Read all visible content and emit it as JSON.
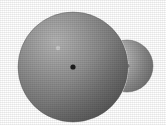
{
  "scene": {
    "title": "Two overlapping shaded spheres",
    "canvas": {
      "width": 166,
      "height": 125
    },
    "background_color": "#ffffff",
    "caption": ""
  },
  "palette": {
    "background": "#ffffff",
    "sphere_light": "#b9b9b9",
    "sphere_mid": "#8d8d8d",
    "sphere_dark": "#6a6a6a",
    "sphere_rim": "#5e5e5e",
    "center_dot": "#1e1e1e",
    "highlight_speck": "#c9c9c9",
    "small_sphere_light": "#c6c6c6",
    "small_sphere_mid": "#9a9a9a",
    "small_sphere_dark": "#6e6e6e"
  },
  "objects": {
    "large_sphere": {
      "name": "Large sphere",
      "center_x": 73,
      "center_y": 67,
      "radius": 55,
      "fill_light": "#bcbcbc",
      "fill_mid": "#8c8c8c",
      "fill_dark": "#676767",
      "light_direction": "upper-left",
      "center_dot": {
        "x": 73,
        "y": 67,
        "radius": 2.6,
        "color": "#1c1c1c"
      },
      "highlight_speck": {
        "x": 58,
        "y": 48,
        "radius": 2.2,
        "color": "#cfcfcf"
      }
    },
    "small_sphere": {
      "name": "Small sphere",
      "center_x": 127,
      "center_y": 66,
      "radius": 26,
      "fill_light": "#cccccc",
      "fill_mid": "#9b9b9b",
      "fill_dark": "#6d6d6d",
      "light_direction": "left",
      "occluded_by": "large_sphere",
      "center_dot": {
        "x": 127,
        "y": 66,
        "radius": 2.3,
        "color": "#1c1c1c"
      }
    }
  },
  "labels": {
    "large_sphere_label": "",
    "small_sphere_label": ""
  }
}
